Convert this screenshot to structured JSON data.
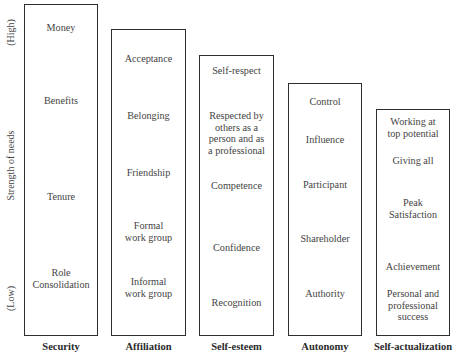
{
  "axis": {
    "high": "(High)",
    "title": "Strength of needs",
    "low": "(Low)"
  },
  "columns": [
    {
      "category": "Security",
      "items": [
        "Money",
        "Benefits",
        "Tenure",
        "Role\nConsolidation"
      ]
    },
    {
      "category": "Affiliation",
      "items": [
        "Acceptance",
        "Belonging",
        "Friendship",
        "Formal\nwork group",
        "Informal\nwork group"
      ]
    },
    {
      "category": "Self-esteem",
      "items": [
        "Self-respect",
        "Respected by\nothers as a\nperson and as\na professional",
        "Competence",
        "Confidence",
        "Recognition"
      ]
    },
    {
      "category": "Autonomy",
      "items": [
        "Control",
        "Influence",
        "Participant",
        "Shareholder",
        "Authority"
      ]
    },
    {
      "category": "Self-actualization",
      "items": [
        "Working at\ntop potential",
        "Giving all",
        "Peak\nSatisfaction",
        "Achievement",
        "Personal and\nprofessional\nsuccess"
      ]
    }
  ]
}
